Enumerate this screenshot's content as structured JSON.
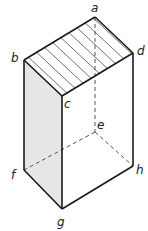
{
  "diagram": {
    "type": "cuboid",
    "colors": {
      "edge": "#1a1a1a",
      "hidden_edge": "#555555",
      "shaded_face": "#e6e6e6",
      "hatch": "#333333"
    },
    "vertices": {
      "a": {
        "label": "a",
        "x": 95,
        "y": 17
      },
      "b": {
        "label": "b",
        "x": 24,
        "y": 60
      },
      "c": {
        "label": "c",
        "x": 62,
        "y": 96
      },
      "d": {
        "label": "d",
        "x": 133,
        "y": 53
      },
      "e": {
        "label": "e",
        "x": 95,
        "y": 132
      },
      "f": {
        "label": "f",
        "x": 24,
        "y": 170
      },
      "g": {
        "label": "g",
        "x": 62,
        "y": 209
      },
      "h": {
        "label": "h",
        "x": 133,
        "y": 166
      }
    },
    "visible_edges": [
      "ab",
      "bc",
      "cd",
      "da",
      "bf",
      "cg",
      "dh",
      "fg",
      "gh"
    ],
    "hidden_edges": [
      "ae",
      "ef",
      "eh"
    ],
    "hatched_face": "abcd",
    "shaded_face": "bcgf"
  }
}
